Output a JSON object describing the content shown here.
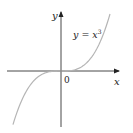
{
  "chart_data": {
    "type": "line",
    "title": "",
    "equation_label": "y = x³",
    "xlabel": "x",
    "ylabel": "y",
    "origin_label": "0",
    "series": [
      {
        "name": "y = x^3",
        "x": [
          -1.0,
          -0.75,
          -0.5,
          -0.25,
          0,
          0.25,
          0.5,
          0.75,
          1.0
        ],
        "values": [
          -1.0,
          -0.421875,
          -0.125,
          -0.015625,
          0,
          0.015625,
          0.125,
          0.421875,
          1.0
        ],
        "color": "#b5b5b5"
      }
    ],
    "grid": false,
    "axis_color": "#222222",
    "ticks": "none"
  },
  "labels": {
    "y_axis": "y",
    "x_axis": "x",
    "origin": "0",
    "eq_lhs": "y = x",
    "eq_exp": "3"
  }
}
